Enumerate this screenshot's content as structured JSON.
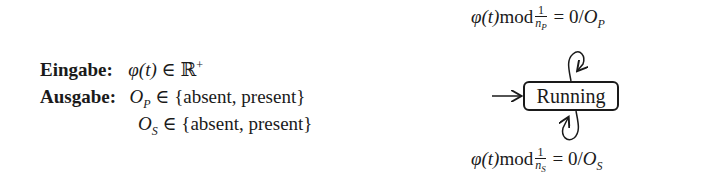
{
  "spec": {
    "input": {
      "label": "Eingabe:",
      "expr_lhs": "φ(t)",
      "relation": "∈",
      "set": "ℝ",
      "set_sup": "+"
    },
    "output": {
      "label": "Ausgabe:",
      "rows": [
        {
          "var": "O",
          "sub": "P",
          "relation": "∈",
          "set": "{absent, present}"
        },
        {
          "var": "O",
          "sub": "S",
          "relation": "∈",
          "set": "{absent, present}"
        }
      ]
    }
  },
  "automaton": {
    "state": {
      "label": "Running"
    },
    "initial_arrow": true,
    "transitions": [
      {
        "position": "top",
        "guard_lhs": "φ(t)",
        "op": "mod",
        "frac_num": "1",
        "frac_den_var": "n",
        "frac_den_sub": "P",
        "eq": "= 0/",
        "output_var": "O",
        "output_sub": "P"
      },
      {
        "position": "bottom",
        "guard_lhs": "φ(t)",
        "op": "mod",
        "frac_num": "1",
        "frac_den_var": "n",
        "frac_den_sub": "S",
        "eq": "= 0/",
        "output_var": "O",
        "output_sub": "S"
      }
    ]
  },
  "colors": {
    "ink": "#1a1a1a",
    "background": "#ffffff"
  }
}
